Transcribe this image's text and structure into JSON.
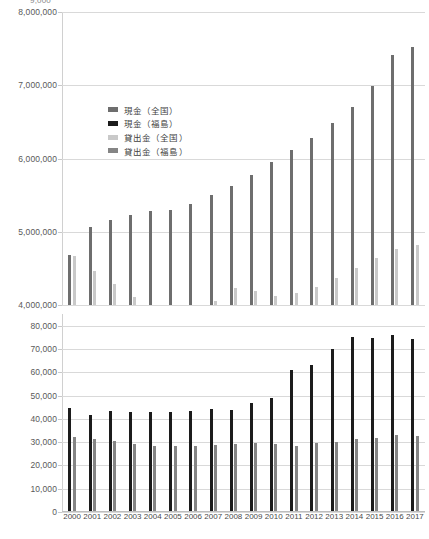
{
  "chart_data": {
    "type": "bar",
    "title": "",
    "subtitle": "",
    "xlabel": "",
    "ylabel": "",
    "broken_axis": true,
    "grid": true,
    "legend_position": "inside-upper-left",
    "categories": [
      "2000",
      "2001",
      "2002",
      "2003",
      "2004",
      "2005",
      "2006",
      "2007",
      "2008",
      "2009",
      "2010",
      "2011",
      "2012",
      "2013",
      "2014",
      "2015",
      "2016",
      "2017"
    ],
    "panels": [
      {
        "name": "upper-panel",
        "ylim": [
          4000000,
          8000000
        ],
        "yticks": [
          4000000,
          5000000,
          6000000,
          7000000,
          8000000
        ],
        "ytick_labels": [
          "4,000,000",
          "5,000,000",
          "6,000,000",
          "7,000,000",
          "8,000,000"
        ],
        "clipped_top_label": "9,000",
        "series_shown": [
          "現金（全国）",
          "貸出金（全国）"
        ]
      },
      {
        "name": "lower-panel",
        "ylim": [
          0,
          85000
        ],
        "yticks": [
          0,
          10000,
          20000,
          30000,
          40000,
          50000,
          60000,
          70000,
          80000
        ],
        "ytick_labels": [
          "0",
          "10,000",
          "20,000",
          "30,000",
          "40,000",
          "50,000",
          "60,000",
          "70,000",
          "80,000"
        ],
        "series_shown": [
          "現金（福島）",
          "貸出金（福島）"
        ]
      }
    ],
    "series": [
      {
        "name": "現金（全国）",
        "key": "cash_national",
        "color": "#6e6e6e",
        "panel": "upper-panel",
        "values": [
          4690000,
          5060000,
          5160000,
          5230000,
          5290000,
          5300000,
          5380000,
          5500000,
          5620000,
          5770000,
          5950000,
          6110000,
          6280000,
          6490000,
          6710000,
          6990000,
          7420000,
          7520000
        ]
      },
      {
        "name": "現金（福島）",
        "key": "cash_fukushima",
        "color": "#1c1c1c",
        "panel": "lower-panel",
        "values": [
          44800,
          41500,
          43200,
          42900,
          43100,
          42800,
          43300,
          44200,
          43700,
          46800,
          48800,
          60800,
          63200,
          69800,
          75000,
          74800,
          76200,
          74300
        ]
      },
      {
        "name": "貸出金（全国）",
        "key": "loans_national",
        "color": "#c9c9c9",
        "panel": "upper-panel",
        "values": [
          4670000,
          4470000,
          4290000,
          4110000,
          3960000,
          3920000,
          3980000,
          4060000,
          4230000,
          4190000,
          4130000,
          4160000,
          4250000,
          4370000,
          4500000,
          4640000,
          4760000,
          4820000
        ]
      },
      {
        "name": "貸出金（福島）",
        "key": "loans_fukushima",
        "color": "#858585",
        "panel": "lower-panel",
        "values": [
          32300,
          31200,
          30400,
          29400,
          28500,
          28200,
          28400,
          28900,
          29400,
          29600,
          29100,
          28300,
          29800,
          30200,
          31400,
          31900,
          33100,
          32600
        ]
      }
    ],
    "legend": [
      {
        "label": "現金（全国）",
        "color": "#6e6e6e"
      },
      {
        "label": "現金（福島）",
        "color": "#1c1c1c"
      },
      {
        "label": "貸出金（全国）",
        "color": "#c9c9c9"
      },
      {
        "label": "貸出金（福島）",
        "color": "#858585"
      }
    ]
  }
}
